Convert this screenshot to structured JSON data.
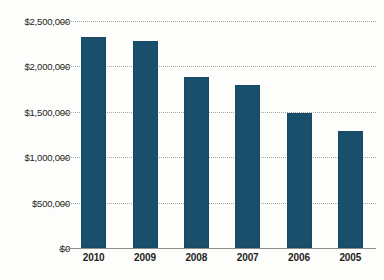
{
  "chart_data": {
    "type": "bar",
    "title": "",
    "subtitle": "",
    "xlabel": "",
    "ylabel": "",
    "categories": [
      "2010",
      "2009",
      "2008",
      "2007",
      "2006",
      "2005"
    ],
    "values": [
      2320000,
      2280000,
      1880000,
      1790000,
      1485000,
      1290000
    ],
    "series": [
      {
        "name": "Amount",
        "values": [
          2320000,
          2280000,
          1880000,
          1790000,
          1485000,
          1290000
        ]
      }
    ],
    "ylim": [
      0,
      2500000
    ],
    "ytick_values": [
      0,
      500000,
      1000000,
      1500000,
      2000000,
      2500000
    ],
    "ytick_labels": [
      "$0",
      "$500,000",
      "$1,000,000",
      "$1,500,000",
      "$2,000,000",
      "$2,500,000"
    ],
    "grid": true,
    "grid_style": "dotted-horizontal",
    "legend": false,
    "legend_position": "none",
    "bar_color": "#1a4f6b",
    "grid_color": "#a8a8a6",
    "axis_color": "#8d8d8b",
    "background_color": "#fdfdfc",
    "text_color": "#1d1d1b"
  }
}
